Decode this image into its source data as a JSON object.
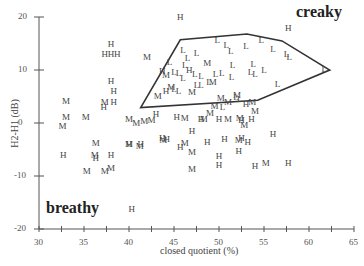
{
  "chart_data": {
    "type": "scatter",
    "title": "",
    "xlabel": "closed quotient (%)",
    "ylabel": "H2-H1 (dB)",
    "xlim": [
      30,
      65
    ],
    "ylim": [
      -20,
      20
    ],
    "x_ticks": [
      "30",
      "35",
      "40",
      "45",
      "50",
      "55",
      "60",
      "65"
    ],
    "y_ticks": [
      "20",
      "10",
      "0",
      "-10",
      "-20"
    ],
    "grid": false,
    "legend": "markers labeled H, M, L (letter glyphs)",
    "annotations": [
      {
        "text": "creaky",
        "x": 60.5,
        "y": 18
      },
      {
        "text": "breathy",
        "x": 34.5,
        "y": -16
      }
    ],
    "polygon": {
      "label": "creaky region",
      "vertices": [
        [
          41.3,
          2.9
        ],
        [
          45.7,
          15.7
        ],
        [
          53.1,
          16.8
        ],
        [
          57.0,
          15.5
        ],
        [
          62.3,
          10.0
        ],
        [
          54.3,
          4.3
        ]
      ]
    },
    "series": [
      {
        "name": "H",
        "points": [
          [
            45.7,
            20
          ],
          [
            57.7,
            18
          ],
          [
            38.0,
            15
          ],
          [
            37.3,
            13
          ],
          [
            38.0,
            13
          ],
          [
            38.7,
            13
          ],
          [
            38.0,
            8
          ],
          [
            38.3,
            6
          ],
          [
            38.3,
            4
          ],
          [
            37.2,
            3
          ],
          [
            43.7,
            9.8
          ],
          [
            46.7,
            10
          ],
          [
            44.1,
            6.1
          ],
          [
            43.0,
            1.7
          ],
          [
            43.7,
            -2.9
          ],
          [
            32.7,
            -6.1
          ],
          [
            36.3,
            -6.6
          ],
          [
            38.0,
            -6.1
          ],
          [
            40.0,
            -3.9
          ],
          [
            41.3,
            -3.9
          ],
          [
            44.2,
            -3.1
          ],
          [
            40.3,
            -16.3
          ],
          [
            48.7,
            -3.6
          ],
          [
            50.0,
            -6.2
          ],
          [
            50.0,
            -8.0
          ],
          [
            52.2,
            -5.2
          ],
          [
            54.0,
            -8.2
          ],
          [
            56.0,
            -2.0
          ],
          [
            57.7,
            -7.5
          ],
          [
            53.0,
            3.5
          ],
          [
            53.6,
            0.8
          ],
          [
            45.3,
            1.2
          ],
          [
            48.0,
            0.7
          ],
          [
            50.0,
            0.8
          ],
          [
            52.5,
            0.6
          ],
          [
            45.7,
            -4.6
          ],
          [
            47.0,
            -1.5
          ],
          [
            50.6,
            -3.0
          ],
          [
            52.5,
            -2.8
          ],
          [
            53.2,
            -3.5
          ]
        ]
      },
      {
        "name": "M",
        "points": [
          [
            42.0,
            12.5
          ],
          [
            44.1,
            9.0
          ],
          [
            44.7,
            6.8
          ],
          [
            43.2,
            5.1
          ],
          [
            48.7,
            11.4
          ],
          [
            49.3,
            7.8
          ],
          [
            47.0,
            5.8
          ],
          [
            50.2,
            4.7
          ],
          [
            51.0,
            4.0
          ],
          [
            53.7,
            4.0
          ],
          [
            52.0,
            5.2
          ],
          [
            49.5,
            3.3
          ],
          [
            49.0,
            1.8
          ],
          [
            54.0,
            2.3
          ],
          [
            33.0,
            4.2
          ],
          [
            33.0,
            1.1
          ],
          [
            32.6,
            -0.5
          ],
          [
            35.2,
            1.1
          ],
          [
            37.3,
            4.0
          ],
          [
            40.0,
            0.7
          ],
          [
            40.8,
            0.0
          ],
          [
            41.7,
            0.4
          ],
          [
            42.5,
            0.5
          ],
          [
            36.3,
            -3.8
          ],
          [
            36.2,
            -6.1
          ],
          [
            35.3,
            -9.0
          ],
          [
            37.3,
            -9.0
          ],
          [
            38.0,
            -8.5
          ],
          [
            40.0,
            -4.0
          ],
          [
            41.2,
            -4.3
          ],
          [
            43.8,
            -3.3
          ],
          [
            46.2,
            -3.8
          ],
          [
            47.0,
            -5.5
          ],
          [
            47.0,
            -8.6
          ],
          [
            52.2,
            -3.3
          ],
          [
            55.2,
            -7.6
          ],
          [
            46.2,
            0.9
          ],
          [
            48.3,
            0.7
          ],
          [
            51.0,
            0.7
          ],
          [
            52.3,
            1.0
          ],
          [
            52.8,
            -0.4
          ]
        ]
      },
      {
        "name": "L",
        "points": [
          [
            46.0,
            13.7
          ],
          [
            47.5,
            13.3
          ],
          [
            46.5,
            12.2
          ],
          [
            49.8,
            15.7
          ],
          [
            50.8,
            14.7
          ],
          [
            51.3,
            13.5
          ],
          [
            53.0,
            14.6
          ],
          [
            54.7,
            15.7
          ],
          [
            56.0,
            14.0
          ],
          [
            57.8,
            12.5
          ],
          [
            57.5,
            13.0
          ],
          [
            53.8,
            11.2
          ],
          [
            51.5,
            11.0
          ],
          [
            53.5,
            9.6
          ],
          [
            54.0,
            9.3
          ],
          [
            44.5,
            11.5
          ],
          [
            45.5,
            9.5
          ],
          [
            46.2,
            11.0
          ],
          [
            47.3,
            9.2
          ],
          [
            48.0,
            8.8
          ],
          [
            48.9,
            7.8
          ],
          [
            49.6,
            9.2
          ],
          [
            50.3,
            9.4
          ],
          [
            51.4,
            8.7
          ],
          [
            55.0,
            10.0
          ],
          [
            56.5,
            7.3
          ],
          [
            61.7,
            10.2
          ],
          [
            45.0,
            6.5
          ],
          [
            45.5,
            6.0
          ],
          [
            47.5,
            7.2
          ],
          [
            48.0,
            7.1
          ],
          [
            51.9,
            5.0
          ],
          [
            52.3,
            4.5
          ],
          [
            50.4,
            3.0
          ],
          [
            45.0,
            9.7
          ],
          [
            46.0,
            8.5
          ]
        ]
      }
    ]
  },
  "labels": {
    "creaky": "creaky",
    "breathy": "breathy",
    "xlabel": "closed quotient (%)",
    "ylabel": "H2-H1 (dB)",
    "x_ticks": [
      "30",
      "35",
      "40",
      "45",
      "50",
      "55",
      "60",
      "65"
    ],
    "y_ticks": [
      "20",
      "10",
      "0",
      "-10",
      "-20"
    ]
  }
}
